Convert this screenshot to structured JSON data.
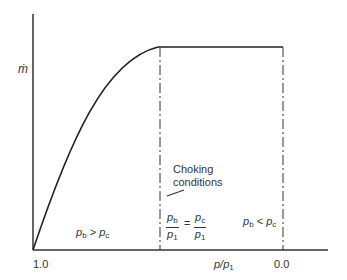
{
  "diagram": {
    "y_axis_label": "ṁ",
    "x_axis_label_main": "p/p",
    "x_axis_label_sub": "1",
    "x_tick_left": "1.0",
    "x_tick_right": "0.0",
    "annotation": {
      "line1": "Choking",
      "line2": "conditions"
    },
    "region_left": {
      "a": "p",
      "a_sub": "b",
      "op": ">",
      "b": "p",
      "b_sub": "c"
    },
    "region_right": {
      "a": "p",
      "a_sub": "b",
      "op": "<",
      "b": "p",
      "b_sub": "c"
    },
    "choke_equation": {
      "lhs_num": "p",
      "lhs_num_sub": "b",
      "lhs_den": "p",
      "lhs_den_sub": "1",
      "eq": "=",
      "rhs_num": "p",
      "rhs_num_sub": "c",
      "rhs_den": "p",
      "rhs_den_sub": "1"
    },
    "line_color": "#222222"
  }
}
